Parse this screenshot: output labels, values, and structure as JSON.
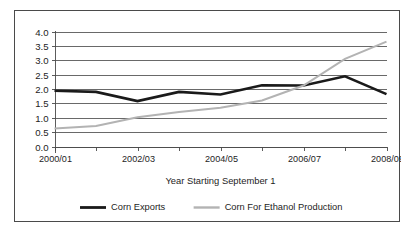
{
  "chart_data": {
    "type": "line",
    "title": "",
    "subtitle": "",
    "xlabel": "Year Starting September 1",
    "ylabel": "",
    "categories": [
      "2000/01",
      "2001/02",
      "2002/03",
      "2003/04",
      "2004/05",
      "2005/06",
      "2006/07",
      "2007/08",
      "2008/09"
    ],
    "tick_labels_shown": [
      "2000/01",
      "2002/03",
      "2004/05",
      "2006/07",
      "2008/09"
    ],
    "ylim": [
      0.0,
      4.0
    ],
    "ystep": 0.5,
    "ytick_labels": [
      "0.0",
      "0.5",
      "1.0",
      "1.5",
      "2.0",
      "2.5",
      "3.0",
      "3.5",
      "4.0"
    ],
    "grid": "horizontal",
    "legend_position": "bottom",
    "series": [
      {
        "name": "Corn Exports",
        "color": "#1a1a1a",
        "stroke_width": 2.6,
        "values": [
          1.94,
          1.9,
          1.58,
          1.9,
          1.81,
          2.13,
          2.12,
          2.44,
          1.82
        ]
      },
      {
        "name": "Corn For Ethanol Production",
        "color": "#b3b3b3",
        "stroke_width": 2.0,
        "values": [
          0.63,
          0.71,
          1.02,
          1.2,
          1.35,
          1.6,
          2.12,
          3.05,
          3.65
        ]
      }
    ]
  },
  "legend": {
    "items": [
      {
        "label": "Corn Exports",
        "color": "#1a1a1a",
        "stroke_width": 2.8
      },
      {
        "label": "Corn For Ethanol Production",
        "color": "#b3b3b3",
        "stroke_width": 2.4
      }
    ]
  },
  "axis": {
    "x_title": "Year Starting September 1"
  },
  "colors": {
    "frame": "#4a4a4a",
    "grid": "#595959",
    "background": "#ffffff",
    "text": "#1d1d1d"
  }
}
